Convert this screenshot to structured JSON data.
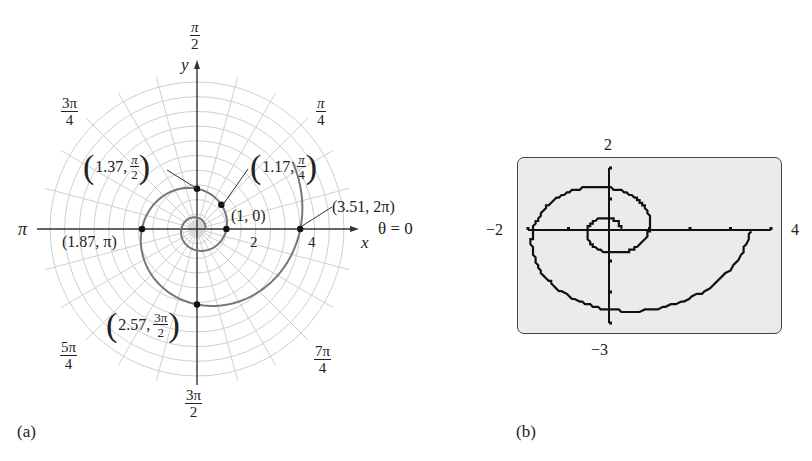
{
  "chart_data": [
    {
      "type": "line",
      "subtype": "polar",
      "panel_label": "(a)",
      "equation_implied": "r = e^(theta/5)",
      "axes": {
        "x_label": "x",
        "y_label": "y",
        "polar_axis_label": "θ = 0",
        "radial_ticks": [
          "2",
          "4"
        ],
        "angle_labels": [
          "θ = 0",
          "π/4",
          "π/2",
          "3π/4",
          "π",
          "5π/4",
          "3π/2",
          "7π/4"
        ],
        "grid": "polar"
      },
      "points": [
        {
          "label": "(1, 0)",
          "r": 1,
          "theta": "0"
        },
        {
          "label": "(1.17, π/4)",
          "r": 1.17,
          "theta": "π/4"
        },
        {
          "label": "(1.37, π/2)",
          "r": 1.37,
          "theta": "π/2"
        },
        {
          "label": "(1.87, π)",
          "r": 1.87,
          "theta": "π"
        },
        {
          "label": "(2.57, 3π/2)",
          "r": 2.57,
          "theta": "3π/2"
        },
        {
          "label": "(3.51, 2π)",
          "r": 3.51,
          "theta": "2π"
        }
      ]
    },
    {
      "type": "line",
      "subtype": "graphing-calculator",
      "panel_label": "(b)",
      "equation_implied": "r = e^(theta/5)",
      "xlim": [
        -2,
        4
      ],
      "ylim": [
        -3,
        2
      ],
      "window_labels": {
        "top": "2",
        "bottom": "−3",
        "left": "−2",
        "right": "4"
      },
      "grid": false
    }
  ],
  "panel_a": {
    "label": "(a)",
    "axis_x": "x",
    "axis_y": "y",
    "theta_zero": "θ = 0",
    "pi": "π",
    "tick_2": "2",
    "tick_4": "4",
    "angles": {
      "pi2": {
        "num": "π",
        "den": "2"
      },
      "pi4": {
        "num": "π",
        "den": "4"
      },
      "pi34": {
        "num": "3π",
        "den": "4"
      },
      "pi54": {
        "num": "5π",
        "den": "4"
      },
      "pi32": {
        "num": "3π",
        "den": "2"
      },
      "pi74": {
        "num": "7π",
        "den": "4"
      }
    },
    "points": {
      "p0": "(1, 0)",
      "p1_val": "1.17,",
      "p1_num": "π",
      "p1_den": "4",
      "p2_val": "1.37,",
      "p2_num": "π",
      "p2_den": "2",
      "p3": "(1.87, π)",
      "p4_val": "2.57,",
      "p4_num": "3π",
      "p4_den": "2",
      "p5": "(3.51, 2π)"
    }
  },
  "panel_b": {
    "label": "(b)",
    "top": "2",
    "bottom": "−3",
    "left": "−2",
    "right": "4"
  }
}
